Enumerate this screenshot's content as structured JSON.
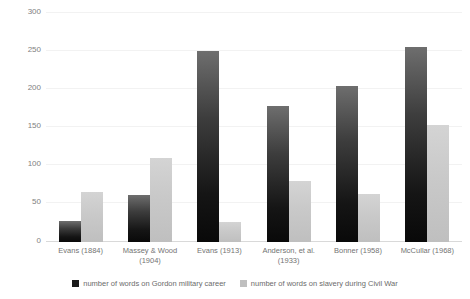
{
  "chart_data": {
    "type": "bar",
    "title": "",
    "subtitle": "",
    "xlabel": "",
    "ylabel": "",
    "ylim": [
      0,
      300
    ],
    "yticks": [
      "0",
      "50",
      "100",
      "150",
      "200",
      "250",
      "300"
    ],
    "grid": true,
    "legend_position": "bottom",
    "categories": [
      "Evans (1884)",
      "Massey & Wood (1904)",
      "Evans (1913)",
      "Anderson, et al. (1933)",
      "Bonner (1958)",
      "McCullar (1968)"
    ],
    "series": [
      {
        "name": "number of words on Gordon military career",
        "color": "#1a1a1a",
        "values": [
          27,
          62,
          250,
          178,
          205,
          255
        ]
      },
      {
        "name": "number of words on slavery during Civil War",
        "color": "#bfbfbf",
        "values": [
          65,
          110,
          26,
          80,
          63,
          153
        ]
      }
    ]
  },
  "axis": {
    "y": {
      "ticks": [
        {
          "label": "300",
          "value": 300
        },
        {
          "label": "250",
          "value": 250
        },
        {
          "label": "200",
          "value": 200
        },
        {
          "label": "150",
          "value": 150
        },
        {
          "label": "100",
          "value": 100
        },
        {
          "label": "50",
          "value": 50
        },
        {
          "label": "0",
          "value": 0
        }
      ]
    },
    "x": {
      "labels": [
        "Evans (1884)",
        "Massey & Wood (1904)",
        "Evans (1913)",
        "Anderson, et al. (1933)",
        "Bonner (1958)",
        "McCullar (1968)"
      ]
    }
  },
  "legend": {
    "items": [
      {
        "label": "number of words on Gordon military career",
        "color": "#1a1a1a"
      },
      {
        "label": "number of words on slavery during Civil War",
        "color": "#bfbfbf"
      }
    ]
  }
}
